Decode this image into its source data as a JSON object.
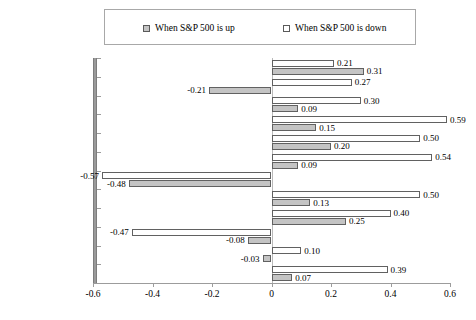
{
  "legend": {
    "entries": [
      {
        "label": "When S&P 500 is up",
        "swatch": "filled-gray-square-icon",
        "color": "#c4c4c4"
      },
      {
        "label": "When S&P 500 is down",
        "swatch": "empty-white-square-icon",
        "color": "#ffffff"
      }
    ]
  },
  "axis": {
    "x_ticks": [
      "-0.6",
      "-0.4",
      "-0.2",
      "0",
      "0.2",
      "0.4",
      "0.6"
    ]
  },
  "chart_data": {
    "type": "bar",
    "orientation": "horizontal",
    "title": "",
    "xlabel": "",
    "ylabel": "",
    "xlim": [
      -0.6,
      0.6
    ],
    "xtick_step": 0.2,
    "grid": false,
    "legend_position": "top",
    "categories": [
      "Equity mkt. neutral",
      "Fixed inc. arb.",
      "Convertible arbitrage",
      "E.D. multi-strat.",
      "Risk arbitrage",
      "Distressed",
      "Short bias",
      "Emg. mkts",
      "L/S equity",
      "Managed futures",
      "Global macro",
      "CSFB Tremont"
    ],
    "series": [
      {
        "name": "When S&P 500 is down",
        "color": "#ffffff",
        "values": [
          0.21,
          0.27,
          0.3,
          0.59,
          0.5,
          0.54,
          -0.57,
          0.5,
          0.4,
          -0.47,
          0.1,
          0.39
        ],
        "labels": [
          "0.21",
          "0.27",
          "0.30",
          "0.59",
          "0.50",
          "0.54",
          "-0.57",
          "0.50",
          "0.40",
          "-0.47",
          "0.10",
          "0.39"
        ]
      },
      {
        "name": "When S&P 500 is up",
        "color": "#c4c4c4",
        "values": [
          0.31,
          -0.21,
          0.09,
          0.15,
          0.2,
          0.09,
          -0.48,
          0.13,
          0.25,
          -0.08,
          -0.03,
          0.07
        ],
        "labels": [
          "0.31",
          "-0.21",
          "0.09",
          "0.15",
          "0.20",
          "0.09",
          "-0.48",
          "0.13",
          "0.25",
          "-0.08",
          "-0.03",
          "0.07"
        ]
      }
    ]
  }
}
